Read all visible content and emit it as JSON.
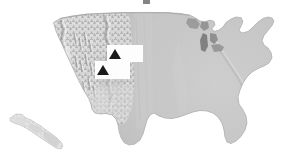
{
  "figure": {
    "title": "",
    "width": 296,
    "height": 168,
    "background_color": "#ffffff"
  },
  "map": {
    "name": "united-states-relief-map",
    "projection_style": "shaded-relief",
    "land_fill_color": "#c9c9c9",
    "land_fill_color_light": "#dedede",
    "relief_highlight_color": "#f2f2f2",
    "relief_shadow_color": "#8f8f8f",
    "water_color": "#a3a3a3",
    "outline_color": "#b8b8b8",
    "halo_color": "#ffffff",
    "regions": [
      {
        "name": "contiguous-united-states",
        "label": ""
      },
      {
        "name": "hawaii-inset",
        "label": ""
      },
      {
        "name": "great-lakes",
        "label": ""
      }
    ]
  },
  "markers": [
    {
      "name": "site-marker-north",
      "glyph": "triangle-up-icon",
      "label": "",
      "box_color": "#fdfdfd",
      "glyph_color": "#1a1a1a",
      "x": 107,
      "y": 45,
      "width": 36,
      "height": 17
    },
    {
      "name": "site-marker-south",
      "glyph": "triangle-up-icon",
      "label": "",
      "box_color": "#fdfdfd",
      "glyph_color": "#1a1a1a",
      "x": 95,
      "y": 61,
      "width": 35,
      "height": 18
    }
  ],
  "artifacts": [
    {
      "name": "top-edge-artifact",
      "label": "",
      "color": "#6e6e6e"
    }
  ]
}
